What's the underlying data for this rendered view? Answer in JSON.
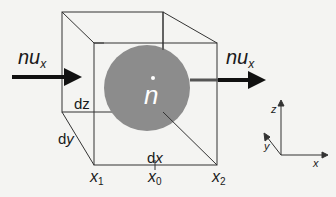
{
  "diagram": {
    "type": "control-volume",
    "colors": {
      "background": "#f4f4f2",
      "lines": "#333333",
      "sphere": "#8c8c8c",
      "arrow": "#111111",
      "sphere_label": "#ffffff"
    },
    "sphere": {
      "label": "n",
      "label_mark": "dot-above"
    },
    "flux_in": {
      "base": "nu",
      "sub": "x"
    },
    "flux_out": {
      "base": "nu",
      "sub": "x"
    },
    "dimensions": {
      "dz": {
        "d": "d",
        "var": "z"
      },
      "dy": {
        "d": "d",
        "var": "y"
      },
      "dx": {
        "d": "d",
        "var": "x"
      }
    },
    "positions": [
      {
        "base": "x",
        "sub": "1"
      },
      {
        "base": "x",
        "sub": "0"
      },
      {
        "base": "x",
        "sub": "2"
      }
    ],
    "axes": {
      "z": "z",
      "y": "y",
      "x": "x"
    }
  }
}
